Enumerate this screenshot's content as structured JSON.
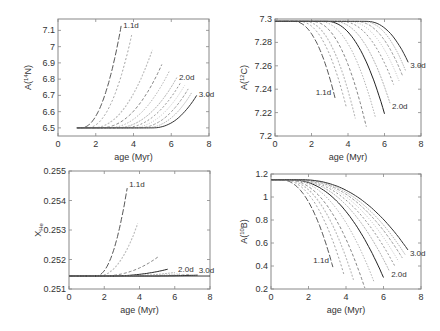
{
  "chart_data": [
    {
      "type": "line",
      "id": "n14",
      "ylabel_base": "A(",
      "ylabel_sup": "14",
      "ylabel_rest": "N)",
      "xlabel": "age (Myr)",
      "xlim": [
        0,
        8
      ],
      "ylim": [
        6.45,
        7.17
      ],
      "xticks": [
        0,
        2,
        4,
        6,
        8
      ],
      "yticks": [
        6.5,
        6.6,
        6.7,
        6.8,
        6.9,
        7,
        7.1
      ],
      "ytick_labels": [
        "6.5",
        "6.6",
        "6.7",
        "6.8",
        "6.9",
        "7",
        "7.1"
      ],
      "baseline": 6.5,
      "start_age": 1.0,
      "series": [
        {
          "name": "1.1d",
          "end_age": 3.35,
          "end_value": 7.13,
          "onset": 1.2,
          "label": "1.1d"
        },
        {
          "name": "1.2d",
          "end_age": 3.9,
          "end_value": 7.07,
          "onset": 1.5
        },
        {
          "name": "1.3d",
          "end_age": 5.0,
          "end_value": 6.98,
          "onset": 1.8
        },
        {
          "name": "1.4d",
          "end_age": 5.5,
          "end_value": 6.89,
          "onset": 2.2
        },
        {
          "name": "1.6d",
          "end_age": 5.9,
          "end_value": 6.85,
          "onset": 2.6
        },
        {
          "name": "2.0d",
          "end_age": 6.3,
          "end_value": 6.81,
          "onset": 3.0,
          "label": "2.0d"
        },
        {
          "name": "2.2d",
          "end_age": 6.5,
          "end_value": 6.78,
          "onset": 3.4
        },
        {
          "name": "2.4d",
          "end_age": 6.7,
          "end_value": 6.76,
          "onset": 3.8
        },
        {
          "name": "2.6d",
          "end_age": 6.9,
          "end_value": 6.74,
          "onset": 4.2
        },
        {
          "name": "2.8d",
          "end_age": 7.1,
          "end_value": 6.72,
          "onset": 4.6
        },
        {
          "name": "3.0d",
          "end_age": 7.35,
          "end_value": 6.7,
          "onset": 5.0,
          "label": "3.0d"
        }
      ]
    },
    {
      "type": "line",
      "id": "c12",
      "ylabel_base": "A(",
      "ylabel_sup": "12",
      "ylabel_rest": "C)",
      "xlabel": "age (Myr)",
      "xlim": [
        0,
        8
      ],
      "ylim": [
        7.2,
        7.3
      ],
      "xticks": [
        0,
        2,
        4,
        6,
        8
      ],
      "yticks": [
        7.2,
        7.22,
        7.24,
        7.26,
        7.28,
        7.3
      ],
      "ytick_labels": [
        "7.2",
        "7.22",
        "7.24",
        "7.26",
        "7.28",
        "7.3"
      ],
      "baseline": 7.298,
      "start_age": 0,
      "series": [
        {
          "name": "1.1d",
          "end_age": 3.3,
          "end_value": 7.232,
          "onset": 1.0,
          "label": "1.1d"
        },
        {
          "name": "1.2d",
          "end_age": 3.9,
          "end_value": 7.225,
          "onset": 1.3
        },
        {
          "name": "1.3d",
          "end_age": 4.4,
          "end_value": 7.215,
          "onset": 1.6
        },
        {
          "name": "1.4d",
          "end_age": 5.0,
          "end_value": 7.208,
          "onset": 2.0
        },
        {
          "name": "1.6d",
          "end_age": 5.5,
          "end_value": 7.216,
          "onset": 2.4
        },
        {
          "name": "1.8d",
          "end_age": 6.0,
          "end_value": 7.219,
          "onset": 2.8
        },
        {
          "name": "2.0d",
          "end_age": 6.3,
          "end_value": 7.228,
          "onset": 3.2,
          "label": "2.0d"
        },
        {
          "name": "2.2d",
          "end_age": 6.5,
          "end_value": 7.244,
          "onset": 3.6
        },
        {
          "name": "2.4d",
          "end_age": 6.8,
          "end_value": 7.247,
          "onset": 4.0
        },
        {
          "name": "2.6d",
          "end_age": 7.0,
          "end_value": 7.251,
          "onset": 4.4
        },
        {
          "name": "2.8d",
          "end_age": 7.15,
          "end_value": 7.256,
          "onset": 4.8
        },
        {
          "name": "3.0d",
          "end_age": 7.3,
          "end_value": 7.263,
          "onset": 5.0,
          "label": "3.0d"
        }
      ]
    },
    {
      "type": "line",
      "id": "xhe",
      "ylabel_base": "X",
      "ylabel_sub": "He",
      "xlabel": "age (Myr)",
      "xlim": [
        0,
        8
      ],
      "ylim": [
        0.251,
        0.255
      ],
      "xticks": [
        0,
        2,
        4,
        6,
        8
      ],
      "yticks": [
        0.251,
        0.252,
        0.253,
        0.254,
        0.255
      ],
      "ytick_labels": [
        "0.251",
        "0.252",
        "0.253",
        "0.254",
        "0.255"
      ],
      "baseline": 0.25144,
      "start_age": 0,
      "series": [
        {
          "name": "1.1d",
          "end_age": 3.3,
          "end_value": 0.25442,
          "onset": 1.5,
          "label": "1.1d"
        },
        {
          "name": "1.2d",
          "end_age": 3.9,
          "end_value": 0.25322,
          "onset": 1.6
        },
        {
          "name": "1.3d",
          "end_age": 5.1,
          "end_value": 0.25211,
          "onset": 1.8
        },
        {
          "name": "1.4d",
          "end_age": 5.6,
          "end_value": 0.25167,
          "onset": 2.2
        },
        {
          "name": "1.6d",
          "end_age": 6.0,
          "end_value": 0.25156,
          "onset": 2.6
        },
        {
          "name": "2.0d",
          "end_age": 6.3,
          "end_value": 0.25152,
          "onset": 3.0,
          "label": "2.0d"
        },
        {
          "name": "2.4d",
          "end_age": 6.8,
          "end_value": 0.25149,
          "onset": 3.6
        },
        {
          "name": "3.0d",
          "end_age": 7.3,
          "end_value": 0.25147,
          "onset": 4.2,
          "label": "3.0d"
        }
      ]
    },
    {
      "type": "line",
      "id": "b10",
      "ylabel_base": "A(",
      "ylabel_sup": "10",
      "ylabel_rest": "B)",
      "xlabel": "age (Myr)",
      "xlim": [
        0,
        8
      ],
      "ylim": [
        0.2,
        1.2
      ],
      "xticks": [
        0,
        2,
        4,
        6,
        8
      ],
      "yticks": [
        0.2,
        0.4,
        0.6,
        0.8,
        1,
        1.2
      ],
      "ytick_labels": [
        "0.2",
        "0.4",
        "0.6",
        "0.8",
        "1",
        "1.2"
      ],
      "baseline": 1.15,
      "start_age": 0,
      "series": [
        {
          "name": "1.1d",
          "end_age": 3.3,
          "end_value": 0.39,
          "onset": 0.5,
          "label": "1.1d"
        },
        {
          "name": "1.2d",
          "end_age": 3.9,
          "end_value": 0.32,
          "onset": 0.6
        },
        {
          "name": "1.3d",
          "end_age": 4.4,
          "end_value": 0.28,
          "onset": 0.7
        },
        {
          "name": "1.4d",
          "end_age": 5.0,
          "end_value": 0.21,
          "onset": 0.8
        },
        {
          "name": "1.6d",
          "end_age": 5.5,
          "end_value": 0.26,
          "onset": 0.9
        },
        {
          "name": "1.8d",
          "end_age": 6.0,
          "end_value": 0.3,
          "onset": 1.0
        },
        {
          "name": "2.0d",
          "end_age": 6.3,
          "end_value": 0.36,
          "onset": 1.1,
          "label": "2.0d"
        },
        {
          "name": "2.2d",
          "end_age": 6.6,
          "end_value": 0.4,
          "onset": 1.2
        },
        {
          "name": "2.4d",
          "end_age": 6.8,
          "end_value": 0.44,
          "onset": 1.3
        },
        {
          "name": "2.6d",
          "end_age": 7.0,
          "end_value": 0.47,
          "onset": 1.4
        },
        {
          "name": "2.8d",
          "end_age": 7.15,
          "end_value": 0.5,
          "onset": 1.5
        },
        {
          "name": "3.0d",
          "end_age": 7.3,
          "end_value": 0.54,
          "onset": 1.6,
          "label": "3.0d"
        }
      ]
    }
  ]
}
